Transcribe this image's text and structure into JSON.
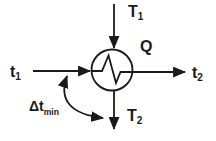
{
  "labels": {
    "hot_inlet": {
      "main": "T",
      "sub": "1"
    },
    "hot_outlet": {
      "main": "T",
      "sub": "2"
    },
    "cold_inlet": {
      "main": "t",
      "sub": "1"
    },
    "cold_outlet": {
      "main": "t",
      "sub": "2"
    },
    "heat_duty": "Q",
    "min_temp_diff": {
      "main": "Δt",
      "sub": "min"
    }
  },
  "colors": {
    "ink": "#1a1a1a",
    "background": "#ffffff"
  }
}
